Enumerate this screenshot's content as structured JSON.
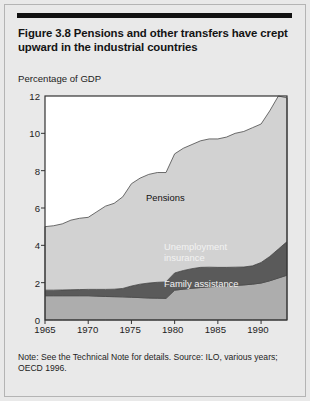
{
  "figure": {
    "title": "Figure 3.8  Pensions and other transfers have crept upward in the industrial countries",
    "note": "Note: See the Technical Note for details. Source: ILO, various years; OECD 1996."
  },
  "chart_data": {
    "type": "area",
    "stacked": true,
    "title": "Pensions and other transfers have crept upward in the industrial countries",
    "subtitle": "",
    "xlabel": "",
    "ylabel": "Percentage of GDP",
    "ylim": [
      0,
      12
    ],
    "xlim": [
      1965,
      1993
    ],
    "grid": false,
    "legend_position": "inside-plot-labels",
    "ytick_labels": [
      "0",
      "2",
      "4",
      "6",
      "8",
      "10",
      "12"
    ],
    "ytick_values": [
      0,
      2,
      4,
      6,
      8,
      10,
      12
    ],
    "xtick_labels": [
      "1965",
      "1970",
      "1975",
      "1980",
      "1985",
      "1990"
    ],
    "xtick_values": [
      1965,
      1970,
      1975,
      1980,
      1985,
      1990
    ],
    "x": [
      1965,
      1966,
      1967,
      1968,
      1969,
      1970,
      1971,
      1972,
      1973,
      1974,
      1975,
      1976,
      1977,
      1978,
      1979,
      1980,
      1981,
      1982,
      1983,
      1984,
      1985,
      1986,
      1987,
      1988,
      1989,
      1990,
      1991,
      1992,
      1993
    ],
    "series": [
      {
        "name": "Family assistance",
        "color": "#adadad",
        "values": [
          1.3,
          1.3,
          1.3,
          1.3,
          1.3,
          1.3,
          1.28,
          1.26,
          1.25,
          1.24,
          1.22,
          1.2,
          1.18,
          1.17,
          1.16,
          1.6,
          1.65,
          1.7,
          1.74,
          1.78,
          1.8,
          1.82,
          1.85,
          1.88,
          1.92,
          1.98,
          2.1,
          2.25,
          2.4
        ]
      },
      {
        "name": "Unemployment insurance",
        "color": "#5a5a5a",
        "values": [
          0.3,
          0.3,
          0.31,
          0.32,
          0.33,
          0.34,
          0.36,
          0.38,
          0.4,
          0.45,
          0.6,
          0.72,
          0.8,
          0.85,
          0.88,
          0.92,
          1.0,
          1.05,
          1.08,
          1.05,
          1.02,
          1.0,
          0.98,
          0.96,
          0.98,
          1.1,
          1.3,
          1.55,
          1.8
        ]
      },
      {
        "name": "Pensions",
        "color": "#d2d2d2",
        "values": [
          3.4,
          3.45,
          3.54,
          3.73,
          3.82,
          3.86,
          4.16,
          4.46,
          4.6,
          4.91,
          5.48,
          5.68,
          5.82,
          5.88,
          5.86,
          6.38,
          6.55,
          6.65,
          6.78,
          6.87,
          6.88,
          6.98,
          7.17,
          7.26,
          7.4,
          7.42,
          7.8,
          8.2,
          7.7
        ]
      }
    ],
    "totals": [
      5.0,
      5.05,
      5.15,
      5.35,
      5.45,
      5.5,
      5.8,
      6.1,
      6.25,
      6.6,
      7.3,
      7.6,
      7.8,
      7.9,
      7.9,
      8.9,
      9.2,
      9.4,
      9.6,
      9.7,
      9.7,
      9.8,
      10.0,
      10.1,
      10.3,
      10.5,
      11.2,
      12.0,
      11.9
    ],
    "annotations": [
      {
        "text": "Pensions",
        "x": 1981,
        "y": 6.0
      },
      {
        "text": "Unemployment insurance",
        "x": 1983,
        "y": 3.0
      },
      {
        "text": "Family assistance",
        "x": 1983,
        "y": 1.2
      }
    ]
  },
  "axis": {
    "unit_label": "Percentage of GDP",
    "y_ticks": [
      "12",
      "10",
      "8",
      "6",
      "4",
      "2",
      "0"
    ],
    "x_ticks": [
      "1965",
      "1970",
      "1975",
      "1980",
      "1985",
      "1990"
    ]
  },
  "series_labels": {
    "pensions": "Pensions",
    "unemployment_line1": "Unemployment",
    "unemployment_line2": "insurance",
    "family": "Family assistance"
  },
  "colors": {
    "pensions": "#d2d2d2",
    "unemployment": "#5a5a5a",
    "family": "#adadad",
    "axis": "#333333",
    "card_background": "#e9e9e9",
    "rule": "#111111"
  }
}
